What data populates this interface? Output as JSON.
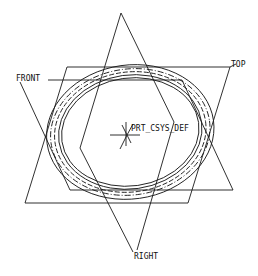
{
  "viewport": {
    "background": "#ffffff",
    "line_color": "#1a1a1a"
  },
  "datums": {
    "front": {
      "label": "FRONT"
    },
    "top": {
      "label": "TOP"
    },
    "right": {
      "label": "RIGHT"
    },
    "csys": {
      "label": "PRT_CSYS_DEF"
    }
  }
}
